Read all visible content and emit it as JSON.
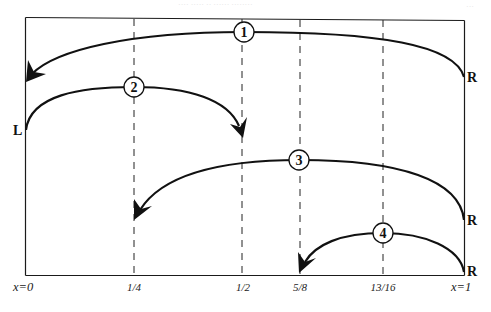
{
  "header": {
    "running_text": "···· ····· ·· ······ ········",
    "page_number": "···"
  },
  "diagram": {
    "title": "",
    "colors": {
      "stroke": "#111111",
      "background": "#ffffff",
      "grid": "#222222"
    },
    "axis": {
      "left_label": "x=0",
      "right_label": "x=1",
      "ticks": [
        {
          "value": 0.25,
          "label": "1/4"
        },
        {
          "value": 0.5,
          "label": "1/2"
        },
        {
          "value": 0.625,
          "label": "5/8"
        },
        {
          "value": 0.8125,
          "label": "13/16"
        }
      ]
    },
    "side_labels": {
      "left": [
        "L"
      ],
      "right": [
        "R",
        "R",
        "R"
      ]
    },
    "arcs": [
      {
        "id": "1",
        "label": "1",
        "from_side": "R",
        "from_x": 1.0,
        "to_x": 0.0,
        "direction": "left"
      },
      {
        "id": "2",
        "label": "2",
        "from_side": "L",
        "from_x": 0.0,
        "to_x": 0.5,
        "direction": "right"
      },
      {
        "id": "3",
        "label": "3",
        "from_side": "R",
        "from_x": 1.0,
        "to_x": 0.25,
        "direction": "left"
      },
      {
        "id": "4",
        "label": "4",
        "from_side": "R",
        "from_x": 1.0,
        "to_x": 0.625,
        "direction": "left"
      }
    ]
  }
}
